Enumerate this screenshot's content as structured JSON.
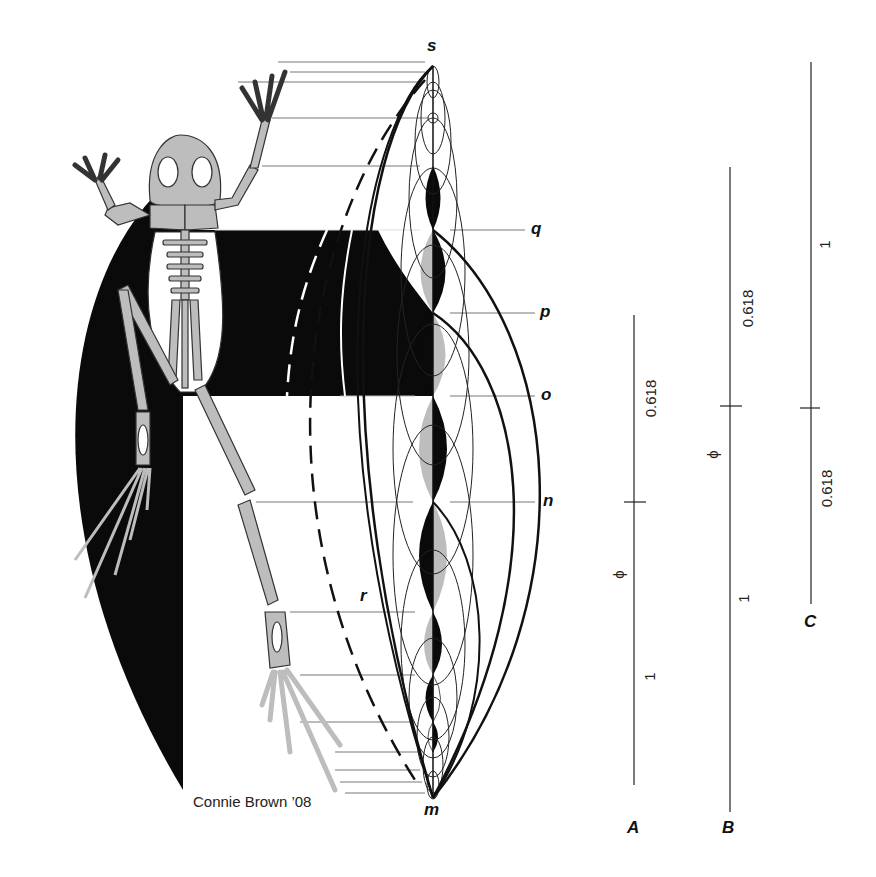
{
  "colors": {
    "background": "#ffffff",
    "ink": "#111111",
    "bone_fill": "#bdbdbd",
    "guide_line": "#777777"
  },
  "points": {
    "s": "s",
    "q": "q",
    "p": "p",
    "o": "o",
    "n": "n",
    "r": "r",
    "m": "m"
  },
  "credit": "Connie Brown ’08",
  "ratio_lines": [
    {
      "name": "A",
      "segments": [
        {
          "label": "0.618"
        },
        {
          "label": "ϕ"
        },
        {
          "label": "1"
        }
      ]
    },
    {
      "name": "B",
      "segments": [
        {
          "label": "0.618"
        },
        {
          "label": "ϕ"
        },
        {
          "label": "1"
        }
      ]
    },
    {
      "name": "C",
      "segments": [
        {
          "label": "1"
        },
        {
          "label": "0.618"
        }
      ]
    }
  ]
}
